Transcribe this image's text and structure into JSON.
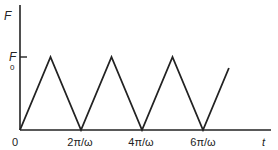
{
  "chart_data": {
    "type": "line",
    "title": "",
    "xlabel": "t",
    "ylabel": "F",
    "y_tick_label_main": "F",
    "y_tick_label_sub": "0",
    "x_tick_labels": [
      "0",
      "2π/ω",
      "4π/ω",
      "6π/ω"
    ],
    "x": [
      0,
      1,
      2,
      3,
      4,
      5,
      6,
      6.85
    ],
    "y": [
      0,
      1,
      0,
      1,
      0,
      1,
      0,
      0.85
    ],
    "x_units": "π/ω",
    "y_units": "F0",
    "grid": false,
    "legend": null,
    "color": "#222222"
  },
  "labels": {
    "y_axis": "F",
    "y_tick_main": "F",
    "y_tick_sub": "0",
    "origin": "0",
    "x_tick_1": "2π/ω",
    "x_tick_2": "4π/ω",
    "x_tick_3": "6π/ω",
    "x_axis": "t"
  }
}
